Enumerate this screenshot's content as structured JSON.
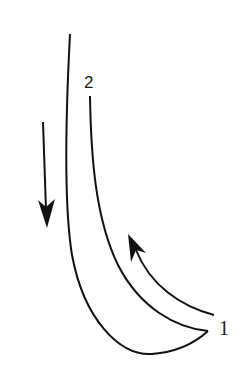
{
  "diagram": {
    "labels": {
      "label_1": "1",
      "label_2": "2"
    },
    "colors": {
      "stroke": "#111111",
      "background": "#ffffff"
    },
    "elements": [
      {
        "name": "outer-curve",
        "description": "long outer line curving from top down to bottom tip"
      },
      {
        "name": "inner-curve",
        "description": "shorter inner line starting below label 2, meeting outer curve at tip near label 1"
      },
      {
        "name": "down-arrow",
        "direction": "down"
      },
      {
        "name": "curved-up-arrow",
        "direction": "up-left along inner curve"
      }
    ]
  }
}
